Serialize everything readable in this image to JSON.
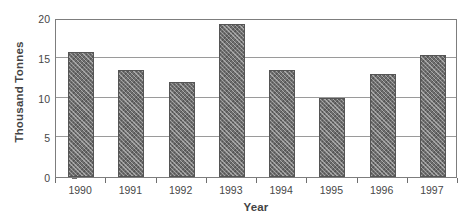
{
  "chart_data": {
    "type": "bar",
    "title": "",
    "subtitle": "",
    "xlabel": "Year",
    "ylabel": "Thousand Tonnes",
    "categories": [
      "1990",
      "1991",
      "1992",
      "1993",
      "1994",
      "1995",
      "1996",
      "1997"
    ],
    "values": [
      15.7,
      13.5,
      12.0,
      19.2,
      13.5,
      9.9,
      12.9,
      15.4
    ],
    "series": [
      {
        "name": "Thousand Tonnes",
        "values": [
          15.7,
          13.5,
          12.0,
          19.2,
          13.5,
          9.9,
          12.9,
          15.4
        ]
      }
    ],
    "ylim": [
      0,
      20
    ],
    "yticks": [
      0,
      5,
      10,
      15,
      20
    ],
    "ytick_labels": [
      "0",
      "5",
      "10",
      "15",
      "20"
    ],
    "grid": "horizontal",
    "legend": "none",
    "bar_color": "#6e6e6e",
    "bar_pattern": "diagonal-crosshatch",
    "frame_color": "#7d7d7d",
    "background": "#ffffff",
    "annotations": []
  }
}
